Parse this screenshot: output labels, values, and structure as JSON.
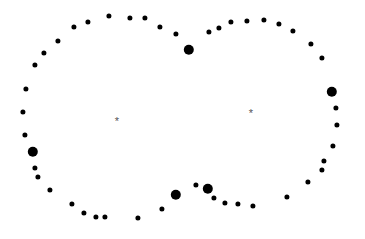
{
  "chart_data": {
    "type": "scatter",
    "title": "",
    "subtitle": "",
    "xlabel": "",
    "ylabel": "",
    "xlim": [
      0,
      365
    ],
    "ylim": [
      0,
      239
    ],
    "grid": false,
    "legend": null,
    "axes_visible": false,
    "background_color": "#ffffff",
    "point_color": "#000000",
    "marker_color": "#555555",
    "series": [
      {
        "name": "cluster-points",
        "marker": "circle",
        "color": "#000000",
        "points": [
          {
            "x": 44,
            "y": 53,
            "r": 2.6
          },
          {
            "x": 58,
            "y": 41,
            "r": 2.6
          },
          {
            "x": 74,
            "y": 27,
            "r": 2.6
          },
          {
            "x": 88,
            "y": 22,
            "r": 2.6
          },
          {
            "x": 109,
            "y": 16,
            "r": 2.6
          },
          {
            "x": 130,
            "y": 18,
            "r": 2.6
          },
          {
            "x": 145,
            "y": 18,
            "r": 2.6
          },
          {
            "x": 160,
            "y": 27,
            "r": 2.6
          },
          {
            "x": 176,
            "y": 34,
            "r": 2.6
          },
          {
            "x": 189,
            "y": 50,
            "r": 5.2
          },
          {
            "x": 209,
            "y": 32,
            "r": 2.6
          },
          {
            "x": 219,
            "y": 28,
            "r": 2.6
          },
          {
            "x": 231,
            "y": 22,
            "r": 2.6
          },
          {
            "x": 247,
            "y": 21,
            "r": 2.6
          },
          {
            "x": 264,
            "y": 20,
            "r": 2.6
          },
          {
            "x": 279,
            "y": 24,
            "r": 2.6
          },
          {
            "x": 293,
            "y": 31,
            "r": 2.6
          },
          {
            "x": 311,
            "y": 44,
            "r": 2.6
          },
          {
            "x": 322,
            "y": 58,
            "r": 2.6
          },
          {
            "x": 332,
            "y": 92,
            "r": 5.2
          },
          {
            "x": 336,
            "y": 108,
            "r": 2.6
          },
          {
            "x": 337,
            "y": 125,
            "r": 2.6
          },
          {
            "x": 333,
            "y": 146,
            "r": 2.6
          },
          {
            "x": 324,
            "y": 161,
            "r": 2.6
          },
          {
            "x": 322,
            "y": 170,
            "r": 2.6
          },
          {
            "x": 308,
            "y": 182,
            "r": 2.6
          },
          {
            "x": 287,
            "y": 197,
            "r": 2.6
          },
          {
            "x": 253,
            "y": 206,
            "r": 2.6
          },
          {
            "x": 238,
            "y": 204,
            "r": 2.6
          },
          {
            "x": 225,
            "y": 203,
            "r": 2.6
          },
          {
            "x": 214,
            "y": 198,
            "r": 2.6
          },
          {
            "x": 208,
            "y": 189,
            "r": 5.2
          },
          {
            "x": 196,
            "y": 185,
            "r": 2.6
          },
          {
            "x": 176,
            "y": 195,
            "r": 5.2
          },
          {
            "x": 162,
            "y": 209,
            "r": 2.6
          },
          {
            "x": 138,
            "y": 218,
            "r": 2.6
          },
          {
            "x": 105,
            "y": 217,
            "r": 2.6
          },
          {
            "x": 96,
            "y": 217,
            "r": 2.6
          },
          {
            "x": 84,
            "y": 213,
            "r": 2.6
          },
          {
            "x": 72,
            "y": 204,
            "r": 2.6
          },
          {
            "x": 50,
            "y": 190,
            "r": 2.6
          },
          {
            "x": 38,
            "y": 177,
            "r": 2.6
          },
          {
            "x": 35,
            "y": 168,
            "r": 2.6
          },
          {
            "x": 33,
            "y": 152,
            "r": 5.2
          },
          {
            "x": 25,
            "y": 135,
            "r": 2.6
          },
          {
            "x": 23,
            "y": 112,
            "r": 2.6
          },
          {
            "x": 26,
            "y": 89,
            "r": 2.6
          },
          {
            "x": 35,
            "y": 65,
            "r": 2.6
          }
        ]
      }
    ],
    "annotations": [
      {
        "label": "*",
        "name": "left-cluster-center",
        "x": 117,
        "y": 121
      },
      {
        "label": "*",
        "name": "right-cluster-center",
        "x": 251,
        "y": 113
      }
    ]
  }
}
